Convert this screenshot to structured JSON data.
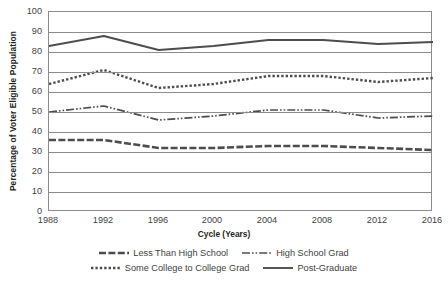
{
  "chart_data": {
    "type": "line",
    "title": "",
    "xlabel": "Cycle (Years)",
    "ylabel": "Percentage of Voter Eligible Population",
    "x": [
      1988,
      1992,
      1996,
      2000,
      2004,
      2008,
      2012,
      2016
    ],
    "xtick_labels": [
      "1988",
      "1992",
      "1996",
      "2000",
      "2004",
      "2008",
      "2012",
      "2016"
    ],
    "ytick_labels": [
      "100",
      "90",
      "80",
      "70",
      "60",
      "50",
      "40",
      "30",
      "20",
      "10",
      "0"
    ],
    "ylim": [
      0,
      100
    ],
    "xlim": [
      1988,
      2016
    ],
    "grid": "horizontal",
    "legend_position": "below",
    "series": [
      {
        "name": "Less Than High School",
        "style": "dashed",
        "color": "#4d4d4d",
        "values": [
          36,
          36,
          32,
          32,
          33,
          33,
          32,
          31
        ]
      },
      {
        "name": "High School Grad",
        "style": "dash-dot",
        "color": "#4d4d4d",
        "values": [
          50,
          53,
          46,
          48,
          51,
          51,
          47,
          48
        ]
      },
      {
        "name": "Some College to College Grad",
        "style": "dotted",
        "color": "#4d4d4d",
        "values": [
          64,
          71,
          62,
          64,
          68,
          68,
          65,
          67
        ]
      },
      {
        "name": "Post-Graduate",
        "style": "solid",
        "color": "#4d4d4d",
        "values": [
          83,
          88,
          81,
          83,
          86,
          86,
          84,
          85
        ]
      }
    ]
  },
  "legend": {
    "row1": [
      {
        "label": "Less Than High School",
        "style": "legend-thick-dash"
      },
      {
        "label": "High School Grad",
        "style": "legend-dash-dot"
      }
    ],
    "row2": [
      {
        "label": "Some College to College Grad",
        "style": "legend-dotted"
      },
      {
        "label": "Post-Graduate",
        "style": "legend-solid"
      }
    ]
  },
  "footnote": {
    "text": ""
  }
}
